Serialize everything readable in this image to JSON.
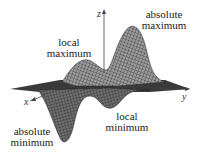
{
  "figure": {
    "labels": {
      "absolute_maximum": [
        "absolute",
        "maximum"
      ],
      "local_maximum": [
        "local",
        "maximum"
      ],
      "local_minimum": [
        "local",
        "minimum"
      ],
      "absolute_minimum": [
        "absolute",
        "minimum"
      ]
    },
    "axes": {
      "x": "x",
      "y": "y",
      "z": "z"
    },
    "colors": {
      "surface": "#8a8a8a",
      "mesh": "#2b2b2b",
      "axis": "#444444"
    }
  }
}
